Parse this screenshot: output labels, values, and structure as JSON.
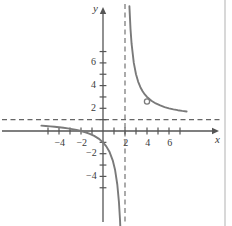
{
  "figure": {
    "title": "",
    "axis_labels": {
      "x": "x",
      "y": "y"
    },
    "colors": {
      "curve": "#7a7a7a",
      "axis": "#555555",
      "asymptote": "#666666",
      "text": "#3a3a3a",
      "background": "#ffffff"
    }
  },
  "chart_data": {
    "type": "line",
    "title": "",
    "xlabel": "x",
    "ylabel": "y",
    "xlim": [
      -5.6,
      7.6
    ],
    "ylim": [
      -5.7,
      7.6
    ],
    "grid": false,
    "legend": null,
    "function": "y = 1 + 4/(x - 2)",
    "x_ticks": [
      -5,
      -4,
      -3,
      -2,
      -1,
      1,
      2,
      3,
      4,
      5,
      6,
      7
    ],
    "x_tick_labels": [
      {
        "value": -4,
        "label": "−4"
      },
      {
        "value": -2,
        "label": "−2"
      },
      {
        "value": 2,
        "label": "2"
      },
      {
        "value": 4,
        "label": "4"
      },
      {
        "value": 6,
        "label": "6"
      }
    ],
    "y_ticks": [
      -5,
      -4,
      -3,
      -2,
      -1,
      1,
      2,
      3,
      4,
      5,
      6,
      7
    ],
    "y_tick_labels": [
      {
        "value": 6,
        "label": "6"
      },
      {
        "value": 4,
        "label": "4"
      },
      {
        "value": 2,
        "label": "2"
      },
      {
        "value": -2,
        "label": "−2"
      },
      {
        "value": -4,
        "label": "−4"
      }
    ],
    "asymptotes": [
      {
        "kind": "vertical",
        "value": 2,
        "style": "dashed"
      },
      {
        "kind": "horizontal",
        "value": 1,
        "style": "dashed"
      }
    ],
    "open_points": [
      {
        "x": 4,
        "y": 2.6,
        "style": "open-circle"
      }
    ],
    "branches": [
      {
        "name": "left-branch",
        "x_range": [
          -5.6,
          1.72
        ],
        "points": [
          [
            -5.6,
            0.4737
          ],
          [
            -5.2,
            0.4444
          ],
          [
            -4.8,
            0.4118
          ],
          [
            -4.4,
            0.375
          ],
          [
            -4.0,
            0.3333
          ],
          [
            -3.6,
            0.2857
          ],
          [
            -3.2,
            0.2308
          ],
          [
            -2.8,
            0.1667
          ],
          [
            -2.4,
            0.0909
          ],
          [
            -2.0,
            0.0
          ],
          [
            -1.6,
            -0.1111
          ],
          [
            -1.2,
            -0.25
          ],
          [
            -0.8,
            -0.4286
          ],
          [
            -0.4,
            -0.6667
          ],
          [
            0.0,
            -1.0
          ],
          [
            0.3,
            -1.3529
          ],
          [
            0.6,
            -1.8571
          ],
          [
            0.9,
            -2.6364
          ],
          [
            1.1,
            -3.4444
          ],
          [
            1.3,
            -4.7143
          ],
          [
            1.45,
            -6.2727
          ],
          [
            1.55,
            -7.8889
          ],
          [
            1.62,
            -9.5263
          ],
          [
            1.68,
            -11.5
          ]
        ]
      },
      {
        "name": "right-branch",
        "x_range": [
          2.3,
          7.6
        ],
        "points": [
          [
            2.3,
            14.3333
          ],
          [
            2.4,
            11.0
          ],
          [
            2.5,
            9.0
          ],
          [
            2.6,
            7.6667
          ],
          [
            2.8,
            6.0
          ],
          [
            3.0,
            5.0
          ],
          [
            3.2,
            4.3333
          ],
          [
            3.4,
            3.8571
          ],
          [
            3.6,
            3.5
          ],
          [
            3.8,
            3.2222
          ],
          [
            4.0,
            3.0
          ],
          [
            4.4,
            2.6667
          ],
          [
            4.8,
            2.4286
          ],
          [
            5.2,
            2.25
          ],
          [
            5.6,
            2.1111
          ],
          [
            6.0,
            2.0
          ],
          [
            6.4,
            1.9091
          ],
          [
            6.8,
            1.8333
          ],
          [
            7.2,
            1.7692
          ],
          [
            7.6,
            1.7143
          ]
        ]
      }
    ]
  }
}
